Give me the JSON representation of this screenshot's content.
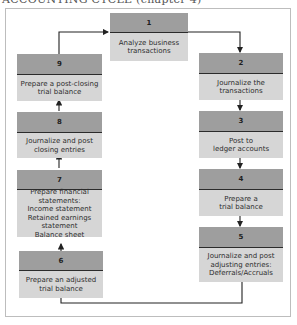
{
  "caption": "ACCOUNTING CYCLE (chapter 4)",
  "colors": {
    "header_fill": "#9e9e9e",
    "body_fill": "#d6d6d6",
    "arrow": "#222222",
    "frame": "#bdbdbd"
  },
  "steps": [
    {
      "number": "1",
      "lines": [
        "Analyze business",
        "transactions"
      ]
    },
    {
      "number": "2",
      "lines": [
        "Journalize the",
        "transactions"
      ]
    },
    {
      "number": "3",
      "lines": [
        "Post to",
        "ledger accounts"
      ]
    },
    {
      "number": "4",
      "lines": [
        "Prepare a",
        "trial balance"
      ]
    },
    {
      "number": "5",
      "lines": [
        "Journalize and post",
        "adjusting entries:",
        "Deferrals/Accruals"
      ]
    },
    {
      "number": "6",
      "lines": [
        "Prepare an adjusted",
        "trial balance"
      ]
    },
    {
      "number": "7",
      "lines": [
        "Prepare financial",
        "statements:",
        "Income statement",
        "Retained earnings statement",
        "Balance sheet"
      ]
    },
    {
      "number": "8",
      "lines": [
        "Journalize and post",
        "closing entries"
      ]
    },
    {
      "number": "9",
      "lines": [
        "Prepare a post-closing",
        "trial balance"
      ]
    }
  ],
  "flow": [
    "1→2",
    "2→3",
    "3→4",
    "4→5",
    "5→6",
    "6→7",
    "7→8",
    "8→9",
    "9→1"
  ]
}
